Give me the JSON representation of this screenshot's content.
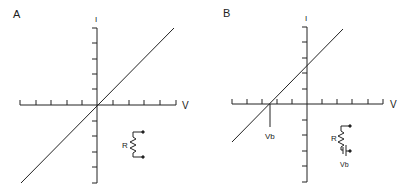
{
  "panels": [
    {
      "id": "A",
      "label": "A",
      "y_axis_label": "I",
      "x_axis_label": "V",
      "curve": "straight line through origin",
      "inset": {
        "resistor_label": "R"
      }
    },
    {
      "id": "B",
      "label": "B",
      "y_axis_label": "I",
      "x_axis_label": "V",
      "curve": "straight line with negative x-intercept at Vb",
      "intercept_label": "Vb",
      "inset": {
        "resistor_label": "R",
        "battery_label": "Vb"
      }
    }
  ],
  "colors": {
    "ink": "#222222",
    "background": "#ffffff"
  }
}
